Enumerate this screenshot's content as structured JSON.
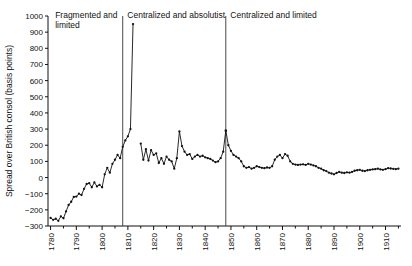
{
  "chart_data": {
    "type": "line",
    "title": "",
    "subtitle": "",
    "xlabel": "",
    "ylabel": "Spread over British consol (basis points)",
    "xlim": [
      1779,
      1916
    ],
    "ylim": [
      -300,
      1000
    ],
    "y_ticks": [
      -300,
      -200,
      -100,
      0,
      100,
      200,
      300,
      400,
      500,
      600,
      700,
      800,
      900,
      1000
    ],
    "y_ticklabels": [
      "-300",
      "-200",
      "-100",
      "0",
      "100",
      "200",
      "300",
      "400",
      "500",
      "600",
      "700",
      "800",
      "900",
      "1000"
    ],
    "x_ticks": [
      1780,
      1790,
      1800,
      1810,
      1820,
      1830,
      1840,
      1850,
      1860,
      1870,
      1880,
      1890,
      1900,
      1910
    ],
    "x_ticklabels": [
      "1780",
      "1790",
      "1800",
      "1810",
      "1820",
      "1830",
      "1840",
      "1850",
      "1860",
      "1870",
      "1880",
      "1890",
      "1900",
      "1910"
    ],
    "x_minor_interval": 5,
    "grid": false,
    "legend": null,
    "annotations": [
      {
        "name": "regime-fragmented-limited",
        "label": "Fragmented and limited",
        "x": 1781,
        "y": 985
      },
      {
        "name": "regime-centralized-absolutist",
        "label": "Centralized and absolutist",
        "x": 1809,
        "y": 985
      },
      {
        "name": "regime-centralized-limited",
        "label": "Centralized and limited",
        "x": 1849,
        "y": 985
      }
    ],
    "vlines": [
      {
        "name": "regime-divider-1808",
        "x": 1808,
        "y_from": -300,
        "y_to": 1000
      },
      {
        "name": "regime-divider-1848",
        "x": 1848,
        "y_from": -300,
        "y_to": 1000
      }
    ],
    "series": [
      {
        "name": "spread-over-british-consol",
        "color": "#111111",
        "marker": "dot",
        "segments": [
          {
            "name": "segment-1780-1812",
            "x": [
              1780,
              1781,
              1782,
              1783,
              1784,
              1785,
              1786,
              1787,
              1788,
              1789,
              1790,
              1791,
              1792,
              1793,
              1794,
              1795,
              1796,
              1797,
              1798,
              1799,
              1800,
              1801,
              1802,
              1803,
              1804,
              1805,
              1806,
              1807,
              1808,
              1809,
              1810,
              1811,
              1812
            ],
            "y": [
              -250,
              -262,
              -255,
              -268,
              -240,
              -252,
              -210,
              -170,
              -150,
              -120,
              -118,
              -100,
              -108,
              -70,
              -40,
              -35,
              -60,
              -30,
              -55,
              -45,
              -60,
              20,
              60,
              30,
              85,
              110,
              140,
              120,
              190,
              230,
              255,
              300,
              950
            ]
          },
          {
            "name": "segment-1815-1848",
            "x": [
              1815,
              1816,
              1817,
              1818,
              1819,
              1820,
              1821,
              1822,
              1823,
              1824,
              1825,
              1826,
              1827,
              1828,
              1829,
              1830,
              1831,
              1832,
              1833,
              1834,
              1835,
              1836,
              1837,
              1838,
              1839,
              1840,
              1841,
              1842,
              1843,
              1844,
              1845,
              1846,
              1847,
              1848
            ],
            "y": [
              210,
              110,
              175,
              105,
              170,
              140,
              150,
              90,
              120,
              85,
              130,
              110,
              100,
              55,
              120,
              285,
              195,
              160,
              140,
              145,
              115,
              130,
              140,
              130,
              135,
              125,
              120,
              115,
              105,
              95,
              100,
              120,
              160,
              290
            ]
          },
          {
            "name": "segment-1848-1915",
            "x": [
              1848,
              1849,
              1850,
              1851,
              1852,
              1853,
              1854,
              1855,
              1856,
              1857,
              1858,
              1859,
              1860,
              1861,
              1862,
              1863,
              1864,
              1865,
              1866,
              1867,
              1868,
              1869,
              1870,
              1871,
              1872,
              1873,
              1874,
              1875,
              1876,
              1877,
              1878,
              1879,
              1880,
              1881,
              1882,
              1883,
              1884,
              1885,
              1886,
              1887,
              1888,
              1889,
              1890,
              1891,
              1892,
              1893,
              1894,
              1895,
              1896,
              1897,
              1898,
              1899,
              1900,
              1901,
              1902,
              1903,
              1904,
              1905,
              1906,
              1907,
              1908,
              1909,
              1910,
              1911,
              1912,
              1913,
              1914,
              1915
            ],
            "y": [
              290,
              200,
              165,
              140,
              130,
              120,
              100,
              70,
              60,
              65,
              55,
              60,
              70,
              65,
              60,
              58,
              62,
              60,
              70,
              110,
              130,
              140,
              120,
              145,
              135,
              100,
              85,
              80,
              78,
              80,
              82,
              78,
              85,
              80,
              75,
              70,
              60,
              55,
              45,
              40,
              30,
              25,
              20,
              28,
              35,
              30,
              28,
              32,
              30,
              35,
              42,
              45,
              48,
              42,
              40,
              45,
              48,
              50,
              52,
              55,
              50,
              48,
              52,
              58,
              56,
              54,
              52,
              55
            ]
          }
        ]
      }
    ]
  }
}
